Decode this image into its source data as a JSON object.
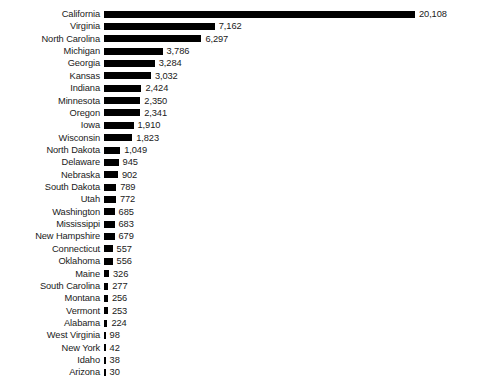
{
  "chart_data": {
    "type": "bar",
    "orientation": "horizontal",
    "title": "",
    "subtitle": "",
    "xlabel": "",
    "ylabel": "",
    "grid": false,
    "legend": null,
    "axis_line": false,
    "tick_labels": [],
    "xlim": [
      0,
      20108
    ],
    "value_label_format": "comma-separated thousands",
    "bar_color": "#000000",
    "text_color": "#1a1a1a",
    "background_color": "#ffffff",
    "categories": [
      "California",
      "Virginia",
      "North Carolina",
      "Michigan",
      "Georgia",
      "Kansas",
      "Indiana",
      "Minnesota",
      "Oregon",
      "Iowa",
      "Wisconsin",
      "North Dakota",
      "Delaware",
      "Nebraska",
      "South Dakota",
      "Utah",
      "Washington",
      "Mississippi",
      "New York",
      "Connecticut",
      "Oklahoma",
      "Maine",
      "South Carolina",
      "Montana",
      "Vermont",
      "Alabama",
      "West Virginia",
      "New York",
      "Idaho",
      "Arizona"
    ],
    "values": [
      20108,
      7162,
      6297,
      3786,
      3284,
      3032,
      2424,
      2350,
      2341,
      1910,
      1823,
      1049,
      945,
      902,
      789,
      772,
      685,
      683,
      679,
      557,
      556,
      326,
      277,
      256,
      253,
      224,
      98,
      42,
      38,
      30
    ],
    "value_labels": [
      "20,108",
      "7,162",
      "6,297",
      "3,786",
      "3,284",
      "3,032",
      "2,424",
      "2,350",
      "2,341",
      "1,910",
      "1,823",
      "1,049",
      "945",
      "902",
      "789",
      "772",
      "685",
      "683",
      "679",
      "557",
      "556",
      "326",
      "277",
      "256",
      "253",
      "224",
      "98",
      "42",
      "38",
      "30"
    ]
  },
  "rows": [
    {
      "label": "California",
      "value": 20108,
      "value_label": "20,108"
    },
    {
      "label": "Virginia",
      "value": 7162,
      "value_label": "7,162"
    },
    {
      "label": "North Carolina",
      "value": 6297,
      "value_label": "6,297"
    },
    {
      "label": "Michigan",
      "value": 3786,
      "value_label": "3,786"
    },
    {
      "label": "Georgia",
      "value": 3284,
      "value_label": "3,284"
    },
    {
      "label": "Kansas",
      "value": 3032,
      "value_label": "3,032"
    },
    {
      "label": "Indiana",
      "value": 2424,
      "value_label": "2,424"
    },
    {
      "label": "Minnesota",
      "value": 2350,
      "value_label": "2,350"
    },
    {
      "label": "Oregon",
      "value": 2341,
      "value_label": "2,341"
    },
    {
      "label": "Iowa",
      "value": 1910,
      "value_label": "1,910"
    },
    {
      "label": "Wisconsin",
      "value": 1823,
      "value_label": "1,823"
    },
    {
      "label": "North Dakota",
      "value": 1049,
      "value_label": "1,049"
    },
    {
      "label": "Delaware",
      "value": 945,
      "value_label": "945"
    },
    {
      "label": "Nebraska",
      "value": 902,
      "value_label": "902"
    },
    {
      "label": "South Dakota",
      "value": 789,
      "value_label": "789"
    },
    {
      "label": "Utah",
      "value": 772,
      "value_label": "772"
    },
    {
      "label": "Washington",
      "value": 685,
      "value_label": "685"
    },
    {
      "label": "Mississippi",
      "value": 683,
      "value_label": "683"
    },
    {
      "label": "New Hampshire",
      "value": 679,
      "value_label": "679"
    },
    {
      "label": "Connecticut",
      "value": 557,
      "value_label": "557"
    },
    {
      "label": "Oklahoma",
      "value": 556,
      "value_label": "556"
    },
    {
      "label": "Maine",
      "value": 326,
      "value_label": "326"
    },
    {
      "label": "South Carolina",
      "value": 277,
      "value_label": "277"
    },
    {
      "label": "Montana",
      "value": 256,
      "value_label": "256"
    },
    {
      "label": "Vermont",
      "value": 253,
      "value_label": "253"
    },
    {
      "label": "Alabama",
      "value": 224,
      "value_label": "224"
    },
    {
      "label": "West Virginia",
      "value": 98,
      "value_label": "98"
    },
    {
      "label": "New York",
      "value": 42,
      "value_label": "42"
    },
    {
      "label": "Idaho",
      "value": 38,
      "value_label": "38"
    },
    {
      "label": "Arizona",
      "value": 30,
      "value_label": "30"
    }
  ]
}
